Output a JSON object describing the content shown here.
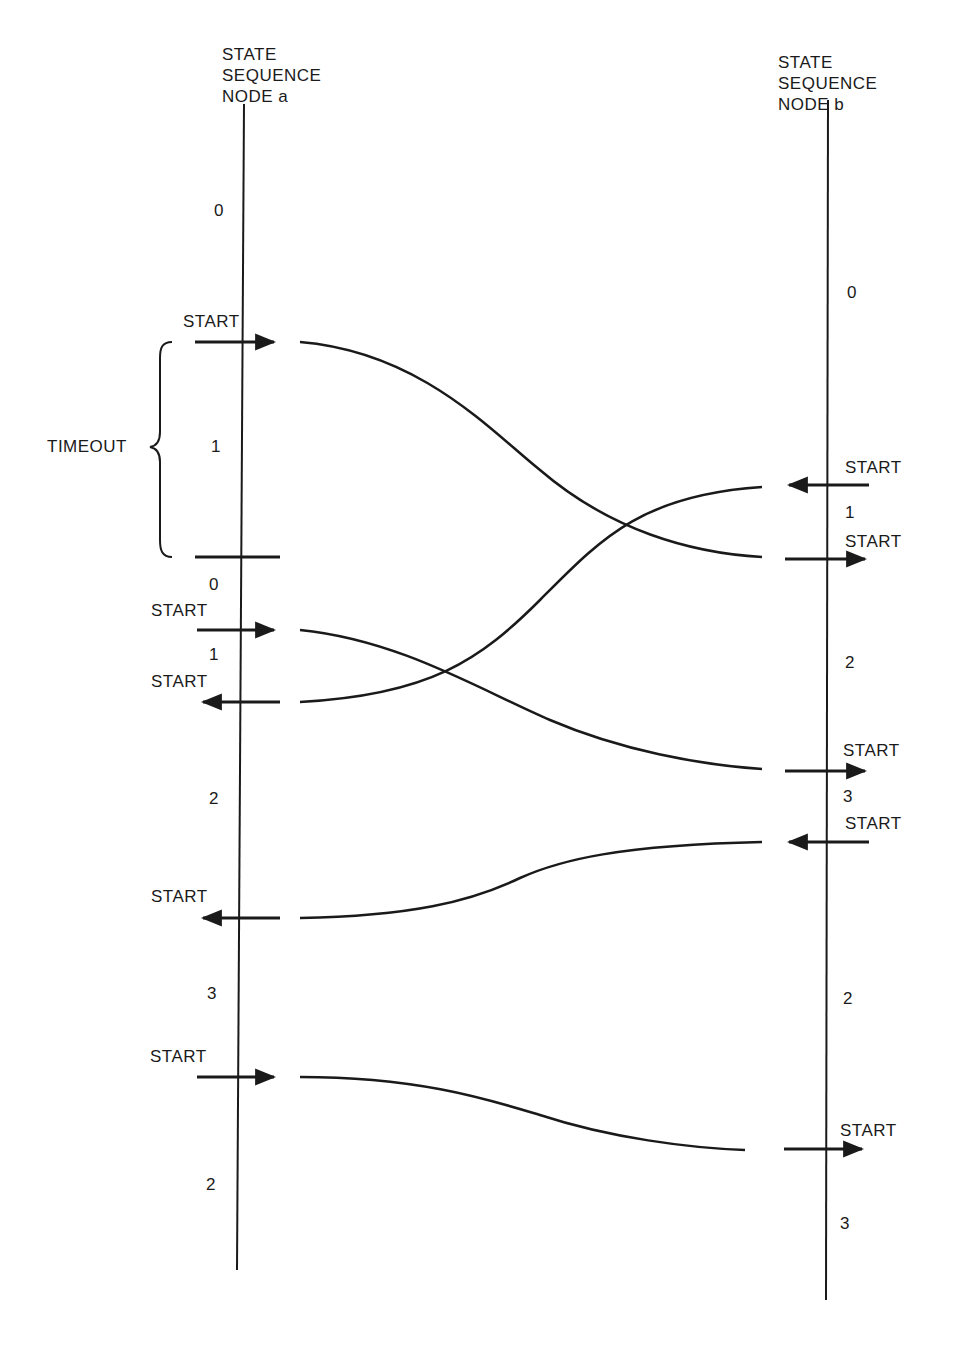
{
  "node_a": {
    "header": [
      "STATE",
      "SEQUENCE",
      "NODE a"
    ],
    "states": [
      "0",
      "1",
      "0",
      "1",
      "2",
      "3",
      "2"
    ],
    "start_labels": [
      "START",
      "START",
      "START",
      "START",
      "START"
    ],
    "timeout_label": "TIMEOUT"
  },
  "node_b": {
    "header": [
      "STATE",
      "SEQUENCE",
      "NODE b"
    ],
    "states": [
      "0",
      "1",
      "2",
      "3",
      "2",
      "3"
    ],
    "start_labels": [
      "START",
      "START",
      "START",
      "START",
      "START"
    ]
  },
  "colors": {
    "ink": "#1a1a1a",
    "background": "#ffffff"
  }
}
